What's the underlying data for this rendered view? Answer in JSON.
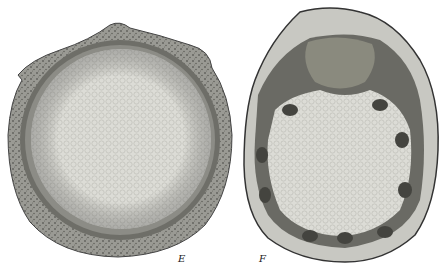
{
  "figure": {
    "panels": [
      {
        "label": "E",
        "description": "cross-section of stem, circular with thick cortex"
      },
      {
        "label": "F",
        "description": "cross-section of stem, lobed with ring of vascular bundles"
      }
    ]
  },
  "colors": {
    "background": "#ffffff",
    "cortex": "#8a8a84",
    "pith": "#d6d6d0",
    "dark_ring": "#5a5a55",
    "bundle": "#4a4a46"
  }
}
